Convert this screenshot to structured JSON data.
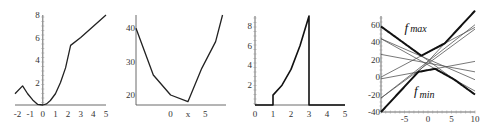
{
  "chart_data": [
    {
      "type": "line",
      "title": "",
      "xlabel": "",
      "ylabel": "",
      "xlim": [
        -2.2,
        5
      ],
      "ylim": [
        0,
        8
      ],
      "x_ticks": [
        "-2",
        "-1",
        "0",
        "1",
        "2",
        "3",
        "4",
        "5"
      ],
      "y_ticks": [
        "2",
        "4",
        "6",
        "8"
      ],
      "series": [
        {
          "name": "f",
          "x": [
            -2.2,
            -1.6,
            -1.2,
            -0.8,
            -0.4,
            0,
            0.3,
            0.6,
            1.0,
            1.4,
            1.8,
            2.2,
            3,
            4,
            5
          ],
          "y": [
            1.0,
            1.7,
            1.0,
            0.45,
            0.05,
            0,
            0.1,
            0.4,
            1.0,
            2.0,
            3.3,
            5.3,
            6.0,
            7.0,
            8.0
          ]
        }
      ]
    },
    {
      "type": "line",
      "title": "",
      "xlabel": "",
      "ylabel": "",
      "xlim": [
        -5,
        8
      ],
      "ylim": [
        17,
        44
      ],
      "x_ticks": [
        "0",
        "x",
        "5"
      ],
      "y_ticks": [
        "20",
        "30",
        "40"
      ],
      "series": [
        {
          "name": "f",
          "x": [
            -5,
            -2.5,
            0,
            2.5,
            4.5,
            6.5,
            7.5
          ],
          "y": [
            40,
            26,
            20,
            18,
            28,
            36,
            44
          ]
        }
      ]
    },
    {
      "type": "line",
      "title": "",
      "xlabel": "",
      "ylabel": "",
      "xlim": [
        0,
        5
      ],
      "ylim": [
        0,
        9
      ],
      "x_ticks": [
        "0",
        "1",
        "2",
        "3",
        "4",
        "5"
      ],
      "y_ticks": [
        "2",
        "4",
        "6",
        "8"
      ],
      "series": [
        {
          "name": "f",
          "x": [
            0,
            1,
            1,
            1.5,
            2,
            2.5,
            3,
            3,
            5
          ],
          "y": [
            0,
            0,
            1,
            2,
            3.6,
            6,
            9,
            0,
            0
          ]
        }
      ]
    },
    {
      "type": "line",
      "title": "",
      "xlabel": "",
      "ylabel": "",
      "xlim": [
        -10,
        10
      ],
      "ylim": [
        -40,
        70
      ],
      "x_ticks": [
        "-5",
        "0",
        "5",
        "10"
      ],
      "y_ticks": [
        "-40",
        "-20",
        "0",
        "20",
        "40",
        "60"
      ],
      "annotations": [
        {
          "text": "f",
          "sub": "max",
          "x": -5,
          "y": 52
        },
        {
          "text": "f",
          "sub": "min",
          "x": -3,
          "y": -20
        }
      ],
      "series": [
        {
          "name": "line1",
          "x": [
            -10,
            10
          ],
          "y": [
            58,
            -20
          ]
        },
        {
          "name": "line2",
          "x": [
            -10,
            10
          ],
          "y": [
            44,
            -16
          ]
        },
        {
          "name": "line3",
          "x": [
            -10,
            10
          ],
          "y": [
            44,
            -3
          ]
        },
        {
          "name": "line4",
          "x": [
            -10,
            10
          ],
          "y": [
            26,
            6
          ]
        },
        {
          "name": "line5",
          "x": [
            -10,
            10
          ],
          "y": [
            -2,
            18
          ]
        },
        {
          "name": "line6",
          "x": [
            -10,
            10
          ],
          "y": [
            0,
            57
          ]
        },
        {
          "name": "line7",
          "x": [
            -10,
            10
          ],
          "y": [
            -24,
            60
          ]
        },
        {
          "name": "line8",
          "x": [
            -10,
            10
          ],
          "y": [
            -24,
            55
          ]
        },
        {
          "name": "line9",
          "x": [
            -10,
            10
          ],
          "y": [
            -40,
            76
          ]
        }
      ],
      "envelopes": [
        "f_max",
        "f_min"
      ]
    }
  ]
}
